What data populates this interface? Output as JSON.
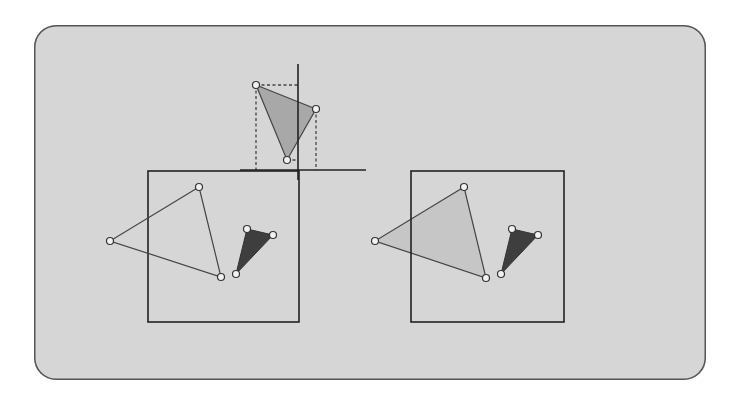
{
  "colors": {
    "panel_bg": "#d6d6d6",
    "panel_border": "#555555",
    "stroke": "#333333",
    "large_triangle_fill_top": "#a8a8a8",
    "large_triangle_fill_right": "#c6c6c6",
    "small_triangle_fill": "#3e3e3e",
    "vertex_fill": "#f2f2f2"
  },
  "diagram": {
    "axes": {
      "vertical": {
        "x": 298,
        "y1": 64,
        "y2": 180
      },
      "horizontal": {
        "y": 170,
        "x1": 240,
        "x2": 366
      }
    },
    "top_triangle": [
      [
        256,
        85
      ],
      [
        316,
        109
      ],
      [
        287,
        160
      ]
    ],
    "left_box": {
      "x": 148,
      "y": 171,
      "w": 151,
      "h": 151
    },
    "left_large_triangle": [
      [
        199,
        187
      ],
      [
        110,
        241
      ],
      [
        221,
        277
      ]
    ],
    "left_small_triangle": [
      [
        247,
        229
      ],
      [
        273,
        235
      ],
      [
        236,
        274
      ]
    ],
    "right_box": {
      "x": 411,
      "y": 171,
      "w": 153,
      "h": 151
    },
    "right_large_triangle": [
      [
        464,
        187
      ],
      [
        375,
        241
      ],
      [
        486,
        278
      ]
    ],
    "right_small_triangle": [
      [
        512,
        229
      ],
      [
        538,
        235
      ],
      [
        501,
        274
      ]
    ]
  }
}
